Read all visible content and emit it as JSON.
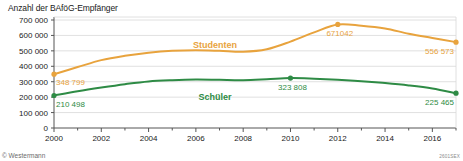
{
  "chart_data": {
    "type": "line",
    "title": "Anzahl der BAföG-Empfänger",
    "xlabel": "",
    "ylabel": "",
    "xlim": [
      2000,
      2017
    ],
    "ylim": [
      0,
      700000
    ],
    "grid": true,
    "legend_position": "inline-on-plot",
    "x": [
      2000,
      2001,
      2002,
      2003,
      2004,
      2005,
      2006,
      2007,
      2008,
      2009,
      2010,
      2011,
      2012,
      2013,
      2014,
      2015,
      2016,
      2017
    ],
    "xticks": [
      2000,
      2002,
      2004,
      2006,
      2008,
      2010,
      2012,
      2014,
      2016
    ],
    "xtick_labels": [
      "2000",
      "2002",
      "2004",
      "2006",
      "2008",
      "2010",
      "2012",
      "2014",
      "2016"
    ],
    "yticks": [
      0,
      100000,
      200000,
      300000,
      400000,
      500000,
      600000,
      700000
    ],
    "ytick_labels": [
      "0",
      "100 000",
      "200 000",
      "300 000",
      "400 000",
      "500 000",
      "600 000",
      "700 000"
    ],
    "series": [
      {
        "name": "Studenten",
        "color": "#E8A33D",
        "values": [
          348799,
          395000,
          440000,
          468000,
          488000,
          500000,
          504000,
          500000,
          494000,
          510000,
          560000,
          620000,
          671042,
          663000,
          645000,
          611000,
          584000,
          556573
        ],
        "labeled_points": [
          {
            "x": 2000,
            "y": 348799,
            "label": "348 799"
          },
          {
            "x": 2012,
            "y": 671042,
            "label": "671042"
          },
          {
            "x": 2017,
            "y": 556573,
            "label": "556 573"
          }
        ]
      },
      {
        "name": "Schüler",
        "color": "#2E8B45",
        "values": [
          210498,
          238000,
          262000,
          284000,
          302000,
          310000,
          314000,
          312000,
          310000,
          316000,
          323808,
          320000,
          313000,
          303000,
          291000,
          276000,
          256000,
          225465
        ],
        "labeled_points": [
          {
            "x": 2000,
            "y": 210498,
            "label": "210 498"
          },
          {
            "x": 2010,
            "y": 323808,
            "label": "323 808"
          },
          {
            "x": 2017,
            "y": 225465,
            "label": "225 465"
          }
        ]
      }
    ]
  },
  "footer": {
    "copyright": "© Westermann",
    "source_code": "2601SEX"
  },
  "colors": {
    "studenten": "#E8A33D",
    "schueler": "#2E8B45",
    "axis": "#555555",
    "grid": "#d8d8d8"
  }
}
